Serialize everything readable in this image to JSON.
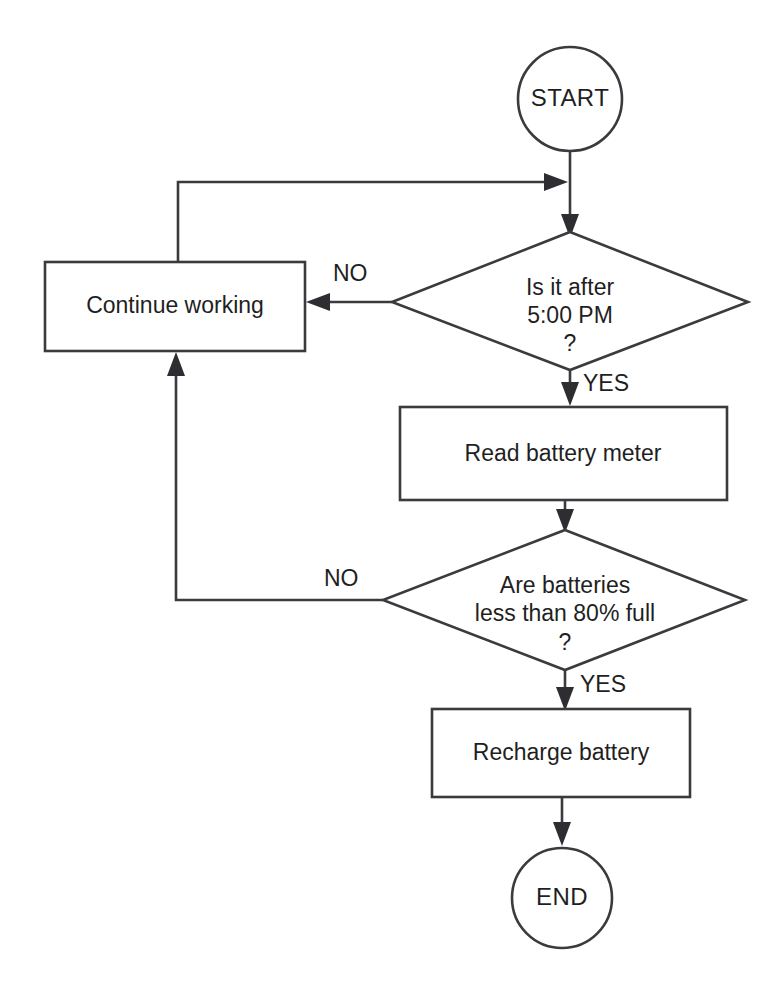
{
  "diagram": {
    "type": "flowchart",
    "colors": {
      "background": "#ffffff",
      "stroke": "#3b3b3f",
      "text": "#1f1f23",
      "arrow_fill": "#2e2e32"
    },
    "nodes": {
      "start": {
        "shape": "circle",
        "label": "START"
      },
      "decision_time": {
        "shape": "diamond",
        "line1": "Is it after",
        "line2": "5:00 PM",
        "line3": "?"
      },
      "continue_working": {
        "shape": "rectangle",
        "label": "Continue working"
      },
      "read_meter": {
        "shape": "rectangle",
        "label": "Read battery meter"
      },
      "decision_battery": {
        "shape": "diamond",
        "line1": "Are batteries",
        "line2": "less than 80% full",
        "line3": "?"
      },
      "recharge": {
        "shape": "rectangle",
        "label": "Recharge battery"
      },
      "end": {
        "shape": "circle",
        "label": "END"
      }
    },
    "edge_labels": {
      "time_no": "NO",
      "time_yes": "YES",
      "battery_no": "NO",
      "battery_yes": "YES"
    },
    "edges": [
      {
        "from": "start",
        "to": "decision_time",
        "label": ""
      },
      {
        "from": "decision_time",
        "to": "continue_working",
        "label": "NO"
      },
      {
        "from": "decision_time",
        "to": "read_meter",
        "label": "YES"
      },
      {
        "from": "continue_working",
        "to": "decision_time",
        "label": ""
      },
      {
        "from": "read_meter",
        "to": "decision_battery",
        "label": ""
      },
      {
        "from": "decision_battery",
        "to": "continue_working",
        "label": "NO"
      },
      {
        "from": "decision_battery",
        "to": "recharge",
        "label": "YES"
      },
      {
        "from": "recharge",
        "to": "end",
        "label": ""
      }
    ]
  }
}
